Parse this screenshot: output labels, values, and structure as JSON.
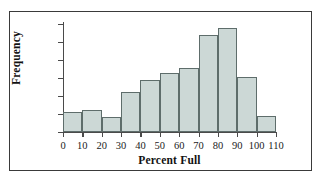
{
  "chart_data": {
    "type": "bar",
    "title": "",
    "xlabel": "Percent Full",
    "ylabel": "Frequency",
    "categories": [
      "0-10",
      "10-20",
      "20-30",
      "30-40",
      "40-50",
      "50-60",
      "60-70",
      "70-80",
      "80-90",
      "90-100",
      "100-110"
    ],
    "bin_edges": [
      0,
      10,
      20,
      30,
      40,
      50,
      60,
      70,
      80,
      90,
      100,
      110
    ],
    "values": [
      11,
      12,
      8.5,
      22,
      29,
      33,
      35.5,
      54,
      58,
      30.5,
      9
    ],
    "xlim": [
      0,
      110
    ],
    "ylim": [
      0,
      60
    ],
    "x_ticks": [
      "0",
      "10",
      "20",
      "30",
      "40",
      "50",
      "60",
      "70",
      "80",
      "90",
      "100",
      "110"
    ],
    "y_ticks": [
      "0",
      "10",
      "20",
      "30",
      "40",
      "50",
      "60"
    ],
    "grid": false,
    "legend": null,
    "bar_fill_color": "#ccd8d6",
    "bar_edge_color": "#5e6d6b",
    "axis_color": "#4a4a4a",
    "frame_color": "#3a3a3a"
  }
}
